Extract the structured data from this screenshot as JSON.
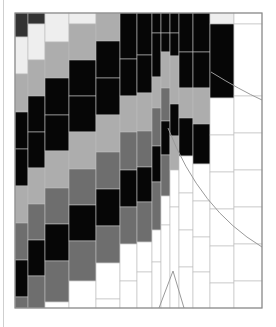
{
  "colors": {
    "K": "#060606",
    "C": "#333333",
    "D": "#6e6e6e",
    "L": "#adadad",
    "P": "#eeeeee",
    "W": "#ffffff",
    "grid": "#bdbdbd",
    "frame": "#8a8a8a",
    "curve": "#9a9a9a"
  },
  "frame": {
    "x": 15,
    "y": 13,
    "w": 247,
    "h": 295
  },
  "columns": [
    {
      "x": 15,
      "w": 13,
      "cells": [
        [
          "C",
          13,
          37
        ],
        [
          "P",
          37,
          74
        ],
        [
          "L",
          74,
          111
        ],
        [
          "L",
          111,
          112
        ],
        [
          "K",
          112,
          149
        ],
        [
          "K",
          149,
          186
        ],
        [
          "L",
          186,
          223
        ],
        [
          "D",
          223,
          260
        ],
        [
          "K",
          260,
          297
        ],
        [
          "D",
          297,
          308
        ]
      ]
    },
    {
      "x": 28,
      "w": 17,
      "cells": [
        [
          "C",
          13,
          24
        ],
        [
          "P",
          24,
          60
        ],
        [
          "L",
          60,
          96
        ],
        [
          "K",
          96,
          132
        ],
        [
          "K",
          132,
          168
        ],
        [
          "L",
          168,
          204
        ],
        [
          "D",
          204,
          240
        ],
        [
          "K",
          240,
          276
        ],
        [
          "D",
          276,
          308
        ]
      ]
    },
    {
      "x": 45,
      "w": 24,
      "cells": [
        [
          "P",
          13,
          42
        ],
        [
          "L",
          42,
          78
        ],
        [
          "K",
          78,
          115
        ],
        [
          "K",
          115,
          151
        ],
        [
          "L",
          151,
          188
        ],
        [
          "D",
          188,
          224
        ],
        [
          "K",
          224,
          261
        ],
        [
          "D",
          261,
          302
        ],
        [
          "W",
          302,
          308
        ]
      ]
    },
    {
      "x": 69,
      "w": 27,
      "cells": [
        [
          "P",
          13,
          24
        ],
        [
          "L",
          24,
          60
        ],
        [
          "K",
          60,
          96
        ],
        [
          "K",
          96,
          132
        ],
        [
          "L",
          132,
          169
        ],
        [
          "D",
          169,
          205
        ],
        [
          "K",
          205,
          241
        ],
        [
          "D",
          241,
          281
        ],
        [
          "W",
          281,
          308
        ]
      ]
    },
    {
      "x": 96,
      "w": 24,
      "cells": [
        [
          "L",
          13,
          41
        ],
        [
          "K",
          41,
          78
        ],
        [
          "K",
          78,
          115
        ],
        [
          "L",
          115,
          152
        ],
        [
          "D",
          152,
          189
        ],
        [
          "K",
          189,
          226
        ],
        [
          "D",
          226,
          263
        ],
        [
          "W",
          263,
          299
        ],
        [
          "W",
          299,
          308
        ]
      ]
    },
    {
      "x": 120,
      "w": 17,
      "cells": [
        [
          "K",
          13,
          59
        ],
        [
          "K",
          59,
          96
        ],
        [
          "L",
          96,
          132
        ],
        [
          "D",
          132,
          170
        ],
        [
          "K",
          170,
          207
        ],
        [
          "D",
          207,
          244
        ],
        [
          "W",
          244,
          281
        ],
        [
          "W",
          281,
          308
        ]
      ]
    },
    {
      "x": 137,
      "w": 15,
      "cells": [
        [
          "K",
          13,
          55
        ],
        [
          "K",
          55,
          93
        ],
        [
          "L",
          93,
          131
        ],
        [
          "D",
          131,
          167
        ],
        [
          "K",
          167,
          202
        ],
        [
          "D",
          202,
          242
        ],
        [
          "W",
          242,
          272
        ],
        [
          "W",
          272,
          308
        ]
      ]
    },
    {
      "x": 152,
      "w": 9,
      "cells": [
        [
          "K",
          13,
          33
        ],
        [
          "K",
          33,
          77
        ],
        [
          "L",
          77,
          108
        ],
        [
          "D",
          108,
          146
        ],
        [
          "K",
          146,
          182
        ],
        [
          "D",
          182,
          230
        ],
        [
          "W",
          230,
          262
        ],
        [
          "W",
          262,
          308
        ]
      ]
    },
    {
      "x": 161,
      "w": 9,
      "cells": [
        [
          "K",
          13,
          33
        ],
        [
          "K",
          33,
          52
        ],
        [
          "L",
          52,
          88
        ],
        [
          "D",
          88,
          121
        ],
        [
          "K",
          121,
          155
        ],
        [
          "D",
          155,
          196
        ],
        [
          "W",
          196,
          225
        ],
        [
          "W",
          225,
          308
        ]
      ]
    },
    {
      "x": 170,
      "w": 9,
      "cells": [
        [
          "K",
          13,
          33
        ],
        [
          "K",
          33,
          56
        ],
        [
          "L",
          56,
          104
        ],
        [
          "K",
          104,
          136
        ],
        [
          "L",
          136,
          170
        ],
        [
          "W",
          170,
          207
        ],
        [
          "W",
          207,
          308
        ]
      ]
    },
    {
      "x": 179,
      "w": 14,
      "cells": [
        [
          "K",
          13,
          52
        ],
        [
          "K",
          52,
          88
        ],
        [
          "L",
          88,
          118
        ],
        [
          "K",
          118,
          156
        ],
        [
          "W",
          156,
          193
        ],
        [
          "W",
          193,
          230
        ],
        [
          "W",
          230,
          267
        ],
        [
          "W",
          267,
          308
        ]
      ]
    },
    {
      "x": 193,
      "w": 17,
      "cells": [
        [
          "K",
          13,
          52
        ],
        [
          "K",
          52,
          88
        ],
        [
          "L",
          88,
          124
        ],
        [
          "K",
          124,
          164
        ],
        [
          "W",
          164,
          201
        ],
        [
          "W",
          201,
          237
        ],
        [
          "W",
          237,
          272
        ],
        [
          "W",
          272,
          308
        ]
      ]
    },
    {
      "x": 210,
      "w": 24,
      "cells": [
        [
          "P",
          13,
          24
        ],
        [
          "K",
          24,
          98
        ],
        [
          "W",
          98,
          135
        ],
        [
          "W",
          135,
          172
        ],
        [
          "W",
          172,
          209
        ],
        [
          "W",
          209,
          246
        ],
        [
          "W",
          246,
          283
        ],
        [
          "W",
          283,
          308
        ]
      ]
    },
    {
      "x": 234,
      "w": 28,
      "cells": [
        [
          "W",
          13,
          24
        ],
        [
          "W",
          24,
          96
        ],
        [
          "W",
          96,
          133
        ],
        [
          "W",
          133,
          170
        ],
        [
          "W",
          170,
          207
        ],
        [
          "W",
          207,
          244
        ],
        [
          "W",
          244,
          281
        ],
        [
          "W",
          281,
          308
        ]
      ]
    }
  ],
  "curves": [
    {
      "name": "upper-decay-curve",
      "d": "M 211 72 Q 240 90 262 100"
    },
    {
      "name": "lower-decay-curve",
      "d": "M 168 128 Q 200 210 262 247"
    },
    {
      "name": "peak-curve",
      "d": "M 159 308 L 173 271 L 184 308"
    }
  ]
}
